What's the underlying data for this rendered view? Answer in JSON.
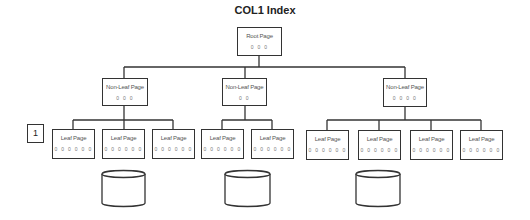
{
  "title": "COL1 Index",
  "tag_label": "1",
  "root": {
    "label": "Root Page",
    "values": "0 0 0"
  },
  "non_leaf": [
    {
      "label": "Non-Leaf Page",
      "values": "0 0 0"
    },
    {
      "label": "Non-Leaf Page",
      "values": "0 0"
    },
    {
      "label": "Non-Leaf Page",
      "values": "0 0 0 0"
    }
  ],
  "leaves": [
    {
      "label": "Leaf Page",
      "values": "0 0 0 0 0 0"
    },
    {
      "label": "Leaf Page",
      "values": "0 0 0 0 0 0"
    },
    {
      "label": "Leaf Page",
      "values": "0 0 0 0 0 0"
    },
    {
      "label": "Leaf Page",
      "values": "0 0 0 0 0 0"
    },
    {
      "label": "Leaf Page",
      "values": "0 0 0 0 0 0"
    },
    {
      "label": "Leaf Page",
      "values": "0 0 0 0 0 0"
    },
    {
      "label": "Leaf Page",
      "values": "0 0 0 0 0 0"
    },
    {
      "label": "Leaf Page",
      "values": "0 0 0 0 0 0"
    },
    {
      "label": "Leaf Page",
      "values": "0 0 0 0 0 0"
    }
  ],
  "data_stores": 3,
  "colors": {
    "stroke": "#333333",
    "background": "#ffffff"
  }
}
